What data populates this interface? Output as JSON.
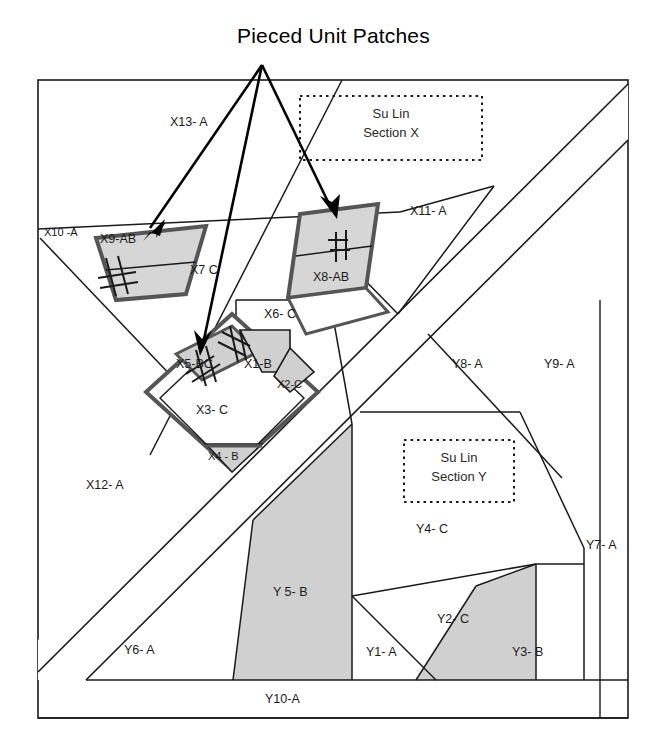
{
  "title": "Pieced Unit Patches",
  "colors": {
    "line": "#1a1a1a",
    "patch_fill": "#d6d6d6",
    "patch_outline": "#555555",
    "shaded_fill": "#d0d0d0",
    "background": "#ffffff",
    "text": "#1a1a1a"
  },
  "annotations": {
    "section_x": {
      "line1": "Su Lin",
      "line2": "Section X"
    },
    "section_y": {
      "line1": "Su Lin",
      "line2": "Section Y"
    }
  },
  "section_x_patches": [
    {
      "id": "X1",
      "label": "X1-B",
      "shaded": true,
      "pieced": false
    },
    {
      "id": "X2",
      "label": "X2-C",
      "shaded": true,
      "pieced": false
    },
    {
      "id": "X3",
      "label": "X3- C",
      "shaded": false,
      "pieced": false
    },
    {
      "id": "X4",
      "label": "X4 - B",
      "shaded": true,
      "pieced": false
    },
    {
      "id": "X5",
      "label": "X5-BC",
      "shaded": true,
      "pieced": true
    },
    {
      "id": "X6",
      "label": "X6- C",
      "shaded": false,
      "pieced": false
    },
    {
      "id": "X7",
      "label": "X7  C",
      "shaded": false,
      "pieced": false
    },
    {
      "id": "X8",
      "label": "X8-AB",
      "shaded": true,
      "pieced": true
    },
    {
      "id": "X9",
      "label": "X9-AB",
      "shaded": true,
      "pieced": true
    },
    {
      "id": "X10",
      "label": "X10 -A",
      "shaded": false,
      "pieced": false
    },
    {
      "id": "X11",
      "label": "X11- A",
      "shaded": false,
      "pieced": false
    },
    {
      "id": "X12",
      "label": "X12- A",
      "shaded": false,
      "pieced": false
    },
    {
      "id": "X13",
      "label": "X13- A",
      "shaded": false,
      "pieced": false
    }
  ],
  "section_y_patches": [
    {
      "id": "Y1",
      "label": "Y1- A",
      "shaded": false
    },
    {
      "id": "Y2",
      "label": "Y2- C",
      "shaded": false
    },
    {
      "id": "Y3",
      "label": "Y3- B",
      "shaded": true
    },
    {
      "id": "Y4",
      "label": "Y4- C",
      "shaded": false
    },
    {
      "id": "Y5",
      "label": "Y 5- B",
      "shaded": true
    },
    {
      "id": "Y6",
      "label": "Y6- A",
      "shaded": false
    },
    {
      "id": "Y7",
      "label": "Y7- A",
      "shaded": false
    },
    {
      "id": "Y8",
      "label": "Y8- A",
      "shaded": false
    },
    {
      "id": "Y9",
      "label": "Y9- A",
      "shaded": false
    },
    {
      "id": "Y10",
      "label": "Y10-A",
      "shaded": false
    }
  ],
  "labels": {
    "x1": "X1-B",
    "x2": "X2-C",
    "x3": "X3- C",
    "x4": "X4 - B",
    "x5": "X5-BC",
    "x6": "X6- C",
    "x7": "X7  C",
    "x8": "X8-AB",
    "x9": "X9-AB",
    "x10": "X10 -A",
    "x11": "X11- A",
    "x12": "X12- A",
    "x13": "X13- A",
    "y1": "Y1- A",
    "y2": "Y2- C",
    "y3": "Y3- B",
    "y4": "Y4- C",
    "y5": "Y 5- B",
    "y6": "Y6- A",
    "y7": "Y7- A",
    "y8": "Y8- A",
    "y9": "Y9- A",
    "y10": "Y10-A"
  },
  "callout": {
    "label": "Pieced Unit Patches",
    "target_count": 3,
    "targets": [
      "X9-AB",
      "X5-BC",
      "X8-AB"
    ]
  }
}
